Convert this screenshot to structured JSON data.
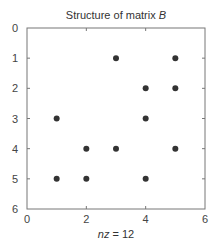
{
  "chart_data": {
    "type": "scatter",
    "title": "Structure of matrix B",
    "title_parts": {
      "prefix": "Structure of matrix ",
      "italic": "B"
    },
    "xlabel": "nz = 12",
    "xlabel_parts": {
      "italic": "nz",
      "suffix": " = 12"
    },
    "ylabel": "",
    "xlim": [
      0,
      6
    ],
    "ylim": [
      0,
      6
    ],
    "y_reversed": true,
    "grid": false,
    "legend": null,
    "xticks": [
      0,
      2,
      4,
      6
    ],
    "yticks": [
      0,
      1,
      2,
      3,
      4,
      5,
      6
    ],
    "marker": "filled-circle",
    "marker_color": "#333333",
    "nz": 12,
    "points": [
      {
        "x": 3,
        "y": 1
      },
      {
        "x": 5,
        "y": 1
      },
      {
        "x": 4,
        "y": 2
      },
      {
        "x": 5,
        "y": 2
      },
      {
        "x": 1,
        "y": 3
      },
      {
        "x": 4,
        "y": 3
      },
      {
        "x": 2,
        "y": 4
      },
      {
        "x": 3,
        "y": 4
      },
      {
        "x": 5,
        "y": 4
      },
      {
        "x": 1,
        "y": 5
      },
      {
        "x": 2,
        "y": 5
      },
      {
        "x": 4,
        "y": 5
      }
    ]
  },
  "colors": {
    "axis": "#777777",
    "marker": "#333333",
    "text": "#333333"
  }
}
